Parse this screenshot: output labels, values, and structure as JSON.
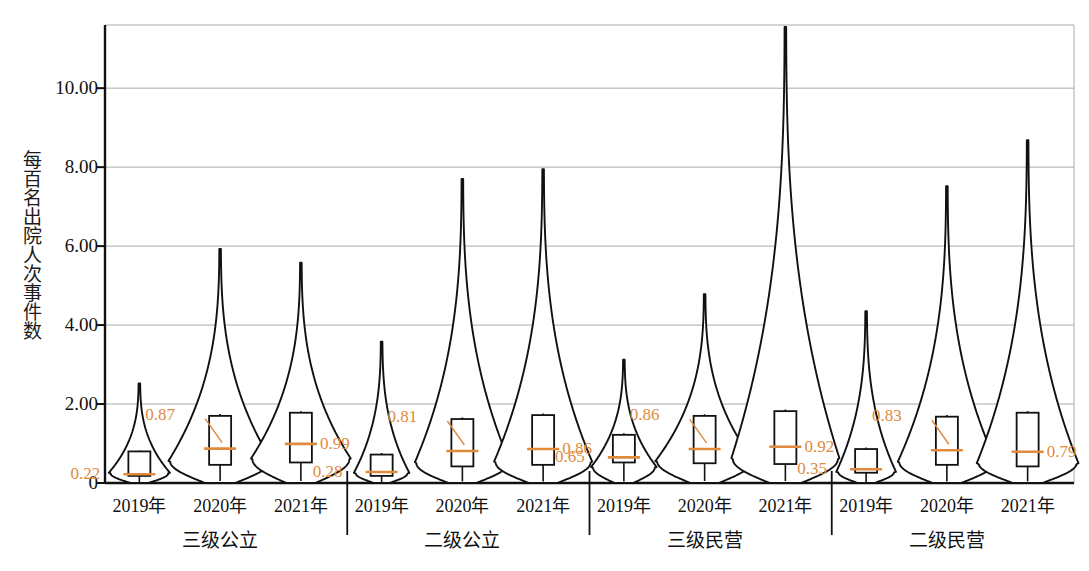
{
  "chart_data": {
    "type": "violin",
    "title": "",
    "xlabel": "",
    "ylabel": "每百名出院人次事件数",
    "ylim": [
      0,
      11.6
    ],
    "yticks": [
      0,
      2,
      4,
      6,
      8,
      10
    ],
    "ytick_labels": [
      "0",
      "2.00",
      "4.00",
      "6.00",
      "8.00",
      "10.00"
    ],
    "grid": true,
    "legend": "none",
    "accent_color": "#E08A3C",
    "line_color": "#111111",
    "grid_color": "#aaaaaa",
    "groups": [
      {
        "name": "三级公立",
        "series": [
          {
            "label": "2019年",
            "median": 0.22,
            "median_text": "0.22",
            "q1": 0.18,
            "q3": 0.8,
            "whisker_low": 0.02,
            "whisker_high": 0.82,
            "violin_max": 2.52,
            "violin_width": 0.58,
            "bulge_at": 0.25,
            "label_side": "left"
          },
          {
            "label": "2020年",
            "median": 0.87,
            "median_text": "0.87",
            "q1": 0.46,
            "q3": 1.7,
            "whisker_low": 0.05,
            "whisker_high": 1.75,
            "violin_max": 5.93,
            "violin_width": 1.0,
            "bulge_at": 0.55,
            "label_side": "left"
          },
          {
            "label": "2021年",
            "median": 0.99,
            "median_text": "0.99",
            "q1": 0.52,
            "q3": 1.78,
            "whisker_low": 0.05,
            "whisker_high": 1.82,
            "violin_max": 5.58,
            "violin_width": 0.97,
            "bulge_at": 0.6,
            "label_side": "right"
          }
        ]
      },
      {
        "name": "二级公立",
        "series": [
          {
            "label": "2019年",
            "median": 0.28,
            "median_text": "0.28",
            "q1": 0.18,
            "q3": 0.72,
            "whisker_low": 0.02,
            "whisker_high": 0.76,
            "violin_max": 3.58,
            "violin_width": 0.52,
            "bulge_at": 0.25,
            "label_side": "left"
          },
          {
            "label": "2020年",
            "median": 0.81,
            "median_text": "0.81",
            "q1": 0.42,
            "q3": 1.62,
            "whisker_low": 0.04,
            "whisker_high": 1.66,
            "violin_max": 7.7,
            "violin_width": 0.92,
            "bulge_at": 0.5,
            "label_side": "left"
          },
          {
            "label": "2021年",
            "median": 0.86,
            "median_text": "0.86",
            "q1": 0.46,
            "q3": 1.72,
            "whisker_low": 0.04,
            "whisker_high": 1.76,
            "violin_max": 7.95,
            "violin_width": 0.95,
            "bulge_at": 0.52,
            "label_side": "right"
          }
        ]
      },
      {
        "name": "三级民营",
        "series": [
          {
            "label": "2019年",
            "median": 0.65,
            "median_text": "0.65",
            "q1": 0.52,
            "q3": 1.22,
            "whisker_low": 0.04,
            "whisker_high": 1.26,
            "violin_max": 3.12,
            "violin_width": 0.62,
            "bulge_at": 0.4,
            "label_side": "left"
          },
          {
            "label": "2020年",
            "median": 0.86,
            "median_text": "0.86",
            "q1": 0.5,
            "q3": 1.7,
            "whisker_low": 0.05,
            "whisker_high": 1.74,
            "violin_max": 4.78,
            "violin_width": 0.95,
            "bulge_at": 0.55,
            "label_side": "left"
          },
          {
            "label": "2021年",
            "median": 0.92,
            "median_text": "0.92",
            "q1": 0.48,
            "q3": 1.82,
            "whisker_low": 0.05,
            "whisker_high": 1.86,
            "violin_max": 11.55,
            "violin_width": 1.05,
            "bulge_at": 0.6,
            "label_side": "right"
          }
        ]
      },
      {
        "name": "二级民营",
        "series": [
          {
            "label": "2019年",
            "median": 0.35,
            "median_text": "0.35",
            "q1": 0.26,
            "q3": 0.86,
            "whisker_low": 0.02,
            "whisker_high": 0.9,
            "violin_max": 4.35,
            "violin_width": 0.56,
            "bulge_at": 0.28,
            "label_side": "left"
          },
          {
            "label": "2020年",
            "median": 0.83,
            "median_text": "0.83",
            "q1": 0.46,
            "q3": 1.68,
            "whisker_low": 0.04,
            "whisker_high": 1.72,
            "violin_max": 7.52,
            "violin_width": 0.95,
            "bulge_at": 0.52,
            "label_side": "left"
          },
          {
            "label": "2021年",
            "median": 0.79,
            "median_text": "0.79",
            "q1": 0.42,
            "q3": 1.78,
            "whisker_low": 0.04,
            "whisker_high": 1.82,
            "violin_max": 8.68,
            "violin_width": 0.98,
            "bulge_at": 0.5,
            "label_side": "right"
          }
        ]
      }
    ]
  }
}
